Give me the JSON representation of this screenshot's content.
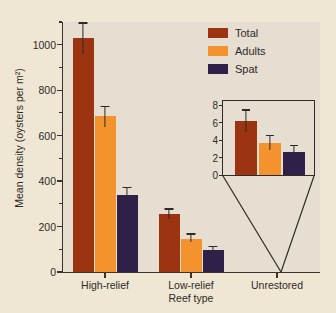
{
  "chart_data": {
    "type": "bar",
    "title": "",
    "xlabel": "Reef type",
    "ylabel": "Mean density (oysters per m²)",
    "categories": [
      "High-relief",
      "Low-relief",
      "Unrestored"
    ],
    "ylim": [
      0,
      1100
    ],
    "yticks": [
      0,
      200,
      400,
      600,
      800,
      1000
    ],
    "yticklabels": [
      "0",
      "200",
      "400",
      "600",
      "800",
      "1000"
    ],
    "yminorticks": [
      100,
      300,
      500,
      700,
      900,
      1100
    ],
    "grid": false,
    "legend_position": "upper right",
    "series": [
      {
        "name": "Total",
        "color": "#9c3311",
        "values": [
          1030,
          255,
          6.2
        ],
        "err_low": [
          70,
          20,
          1.3
        ],
        "err_high": [
          68,
          25,
          1.3
        ]
      },
      {
        "name": "Adults",
        "color": "#f4922e",
        "values": [
          685,
          147,
          3.7
        ],
        "err_low": [
          45,
          17,
          0.8
        ],
        "err_high": [
          45,
          23,
          0.9
        ]
      },
      {
        "name": "Spat",
        "color": "#2e2048",
        "values": [
          340,
          98,
          2.6
        ],
        "err_low": [
          35,
          13,
          0.7
        ],
        "err_high": [
          35,
          17,
          0.8
        ]
      }
    ],
    "inset": {
      "categories": [
        "Unrestored"
      ],
      "ylim": [
        0,
        8
      ],
      "yticks": [
        0,
        2,
        4,
        6,
        8
      ],
      "yticklabels": [
        "0",
        "2",
        "4",
        "6",
        "8"
      ],
      "values": [
        6.2,
        3.7,
        2.6
      ],
      "err_low": [
        1.3,
        0.8,
        0.7
      ],
      "err_high": [
        1.3,
        0.9,
        0.8
      ],
      "series_names": [
        "Total",
        "Adults",
        "Spat"
      ]
    }
  },
  "legend": {
    "items": [
      {
        "label": "Total",
        "color": "#9c3311"
      },
      {
        "label": "Adults",
        "color": "#f4922e"
      },
      {
        "label": "Spat",
        "color": "#2e2048"
      }
    ]
  },
  "colors": {
    "background": "#efe6d4",
    "plot_background": "#e6ded0",
    "axis": "#3b332b",
    "text": "#2e2a26",
    "total": "#9c3311",
    "adults": "#f4922e",
    "spat": "#2e2048"
  }
}
